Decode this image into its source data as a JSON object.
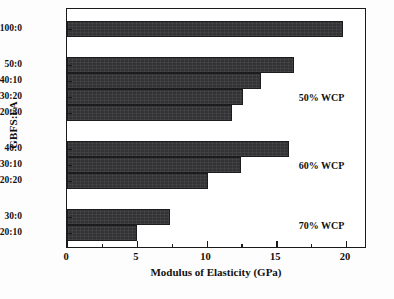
{
  "chart_data": {
    "type": "bar",
    "orientation": "horizontal",
    "title": "",
    "xlabel": "Modulus of Elasticity (GPa)",
    "ylabel": "GBFS:FA",
    "xlim": [
      0,
      21.5
    ],
    "ylim": [
      0,
      12
    ],
    "grid": false,
    "legend": null,
    "bar_color": "#333336",
    "frame_color": "#1a1a1a",
    "categories": [
      "100:0",
      "50:0",
      "40:10",
      "30:20",
      "20:30",
      "40:0",
      "30:10",
      "20:20",
      "30:0",
      "20:10"
    ],
    "values": [
      19.8,
      16.3,
      13.9,
      12.6,
      11.8,
      15.9,
      12.5,
      10.1,
      7.4,
      5.0
    ],
    "bars": [
      {
        "label": "100:0",
        "value": 19.8,
        "slot": 11.0,
        "group": "control"
      },
      {
        "label": "50:0",
        "value": 16.3,
        "slot": 9.2,
        "group": "50% WCP"
      },
      {
        "label": "40:10",
        "value": 13.9,
        "slot": 8.4,
        "group": "50% WCP"
      },
      {
        "label": "30:20",
        "value": 12.6,
        "slot": 7.6,
        "group": "50% WCP"
      },
      {
        "label": "20:30",
        "value": 11.8,
        "slot": 6.8,
        "group": "50% WCP"
      },
      {
        "label": "40:0",
        "value": 15.9,
        "slot": 5.0,
        "group": "60% WCP"
      },
      {
        "label": "30:10",
        "value": 12.5,
        "slot": 4.2,
        "group": "60% WCP"
      },
      {
        "label": "20:20",
        "value": 10.1,
        "slot": 3.4,
        "group": "60% WCP"
      },
      {
        "label": "30:0",
        "value": 7.4,
        "slot": 1.6,
        "group": "70% WCP"
      },
      {
        "label": "20:10",
        "value": 5.0,
        "slot": 0.8,
        "group": "70% WCP"
      }
    ],
    "xticks_major": [
      0,
      5,
      10,
      15,
      20
    ],
    "xticklabels": [
      "0",
      "5",
      "10",
      "15",
      "20"
    ],
    "xticks_minor": [
      2.5,
      7.5,
      12.5,
      17.5
    ],
    "annotations": [
      {
        "text": "50% WCP",
        "x": 16.6,
        "slot": 7.6
      },
      {
        "text": "60% WCP",
        "x": 16.6,
        "slot": 4.2
      },
      {
        "text": "70% WCP",
        "x": 16.6,
        "slot": 1.2
      }
    ]
  }
}
